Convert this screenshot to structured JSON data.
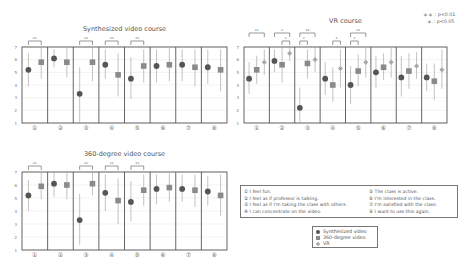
{
  "significance_legend": {
    "p01": "＊＊ : p<0.01",
    "p05": "＊ : p<0.05"
  },
  "questions": [
    {
      "num": "①",
      "text": "I feel fun."
    },
    {
      "num": "②",
      "text": "I feel as if professor is talking."
    },
    {
      "num": "③",
      "text": "I feel as if I'm taking the class with others."
    },
    {
      "num": "④",
      "text": "I can concentrate on the video."
    },
    {
      "num": "⑤",
      "text": "The class is active."
    },
    {
      "num": "⑥",
      "text": "I'm interested in the class."
    },
    {
      "num": "⑦",
      "text": "I'm satisfied with the class."
    },
    {
      "num": "⑧",
      "text": "I want to use this again."
    }
  ],
  "series_legend": [
    {
      "label": "Synthesized video",
      "marker": "circle",
      "color": "#555555"
    },
    {
      "label": "360-degree video",
      "marker": "square",
      "color": "#8a8a8a"
    },
    {
      "label": "VR",
      "marker": "diamond",
      "color": "#a8a8a8"
    }
  ],
  "chart_data": [
    {
      "type": "scatter",
      "subtype": "mean-with-error-bars",
      "title": "Synthesized video course",
      "categories": [
        "①",
        "②",
        "③",
        "④",
        "⑤",
        "⑥",
        "⑦",
        "⑧"
      ],
      "ylim": [
        1,
        7
      ],
      "yticks": [
        1,
        2,
        3,
        4,
        5,
        6,
        7
      ],
      "series": [
        {
          "name": "Synthesized video",
          "values": [
            5.2,
            6.1,
            3.3,
            5.6,
            4.5,
            5.5,
            5.6,
            5.4
          ],
          "err_low": [
            3.9,
            5.4,
            1.0,
            4.5,
            2.9,
            4.2,
            4.3,
            4.1
          ],
          "err_high": [
            6.5,
            6.8,
            5.4,
            6.8,
            6.2,
            6.8,
            6.8,
            6.8
          ]
        },
        {
          "name": "360-degree video",
          "values": [
            5.8,
            5.8,
            5.8,
            4.8,
            5.5,
            5.6,
            5.4,
            5.2
          ],
          "err_low": [
            4.5,
            4.6,
            4.3,
            3.1,
            4.2,
            4.3,
            3.9,
            3.5
          ],
          "err_high": [
            7.0,
            7.0,
            7.0,
            6.5,
            6.8,
            6.9,
            6.8,
            6.8
          ]
        }
      ],
      "significance": [
        {
          "category": "①",
          "level": "**"
        },
        {
          "category": "③",
          "level": "**"
        },
        {
          "category": "④",
          "level": "**"
        },
        {
          "category": "⑤",
          "level": "**"
        }
      ],
      "grid": true
    },
    {
      "type": "scatter",
      "subtype": "mean-with-error-bars",
      "title": "VR course",
      "categories": [
        "①",
        "②",
        "③",
        "④",
        "⑤",
        "⑥",
        "⑦",
        "⑧"
      ],
      "ylim": [
        1,
        7
      ],
      "yticks": [
        1,
        2,
        3,
        4,
        5,
        6,
        7
      ],
      "series": [
        {
          "name": "Synthesized video",
          "values": [
            4.5,
            5.9,
            2.2,
            4.5,
            4.0,
            5.0,
            4.6,
            4.6
          ],
          "err_low": [
            3.3,
            5.0,
            1.0,
            3.2,
            2.5,
            3.8,
            3.1,
            3.5
          ],
          "err_high": [
            5.8,
            6.8,
            3.8,
            5.8,
            5.5,
            6.3,
            6.3,
            5.7
          ]
        },
        {
          "name": "360-degree video",
          "values": [
            5.2,
            5.6,
            5.7,
            4.0,
            5.1,
            5.4,
            5.1,
            4.3
          ],
          "err_low": [
            4.1,
            4.2,
            4.5,
            2.7,
            3.9,
            4.4,
            3.7,
            2.8
          ],
          "err_high": [
            6.3,
            7.0,
            6.8,
            5.4,
            6.4,
            6.5,
            6.5,
            5.7
          ]
        },
        {
          "name": "VR",
          "values": [
            5.8,
            6.5,
            6.0,
            5.3,
            5.8,
            5.8,
            5.5,
            5.2
          ],
          "err_low": [
            4.8,
            5.9,
            5.0,
            3.8,
            4.6,
            4.6,
            4.5,
            3.7
          ],
          "err_high": [
            6.8,
            7.0,
            7.0,
            6.8,
            6.9,
            6.9,
            6.6,
            6.8
          ]
        }
      ],
      "significance": [
        {
          "category": "①",
          "level": "**",
          "pair": "Synthesized-VR"
        },
        {
          "category": "②",
          "level": "*",
          "pair": "Synthesized-VR"
        },
        {
          "category": "②",
          "level": "*",
          "pair": "360-VR"
        },
        {
          "category": "③",
          "level": "**",
          "pair": "Synthesized-VR"
        },
        {
          "category": "③",
          "level": "*",
          "pair": "Synthesized-360"
        },
        {
          "category": "④",
          "level": "*",
          "pair": "360-VR"
        },
        {
          "category": "⑤",
          "level": "**",
          "pair": "Synthesized-VR"
        },
        {
          "category": "⑤",
          "level": "*",
          "pair": "Synthesized-360"
        }
      ],
      "grid": true
    },
    {
      "type": "scatter",
      "subtype": "mean-with-error-bars",
      "title": "360-degree video course",
      "categories": [
        "①",
        "②",
        "③",
        "④",
        "⑤",
        "⑥",
        "⑦",
        "⑧"
      ],
      "ylim": [
        1,
        7
      ],
      "yticks": [
        1,
        2,
        3,
        4,
        5,
        6,
        7
      ],
      "series": [
        {
          "name": "Synthesized video",
          "values": [
            5.2,
            6.1,
            3.3,
            5.4,
            4.7,
            5.7,
            5.7,
            5.5
          ],
          "err_low": [
            4.0,
            5.1,
            1.4,
            4.0,
            3.2,
            4.5,
            4.7,
            4.4
          ],
          "err_high": [
            6.4,
            7.0,
            5.3,
            6.8,
            6.3,
            6.8,
            6.8,
            6.7
          ]
        },
        {
          "name": "360-degree video",
          "values": [
            5.9,
            6.0,
            6.1,
            4.8,
            5.6,
            5.8,
            5.6,
            5.2
          ],
          "err_low": [
            4.9,
            4.9,
            5.2,
            3.0,
            4.4,
            4.7,
            4.3,
            3.6
          ],
          "err_high": [
            7.0,
            7.0,
            7.0,
            6.5,
            6.8,
            6.9,
            6.8,
            6.8
          ]
        }
      ],
      "significance": [
        {
          "category": "①",
          "level": "**"
        },
        {
          "category": "③",
          "level": "**"
        },
        {
          "category": "④",
          "level": "**"
        },
        {
          "category": "⑤",
          "level": "**"
        }
      ],
      "grid": true
    }
  ]
}
